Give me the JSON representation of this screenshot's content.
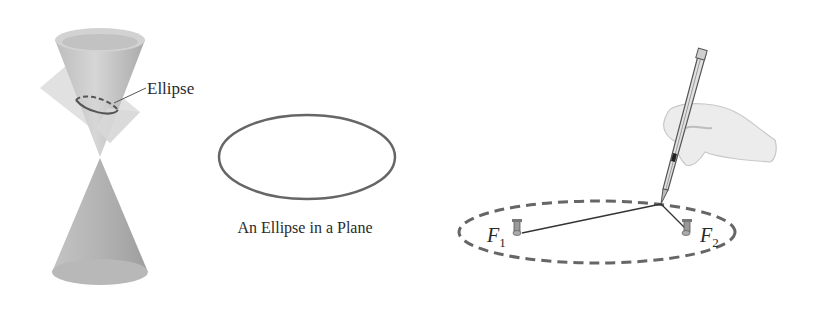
{
  "figure": {
    "cone_panel": {
      "ellipse_label": "Ellipse"
    },
    "plane_panel": {
      "caption": "An Ellipse in a Plane"
    },
    "string_panel": {
      "focus1_label": "F",
      "focus1_sub": "1",
      "focus2_label": "F",
      "focus2_sub": "2"
    },
    "colors": {
      "outline": "#555555",
      "cone_fill": "#c9c9c9",
      "plane_fill": "#dcdcdc",
      "hand_fill": "#ececec"
    }
  }
}
